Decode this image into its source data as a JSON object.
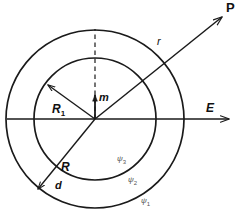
{
  "figure": {
    "background": "#ffffff",
    "stroke_color": "#1a1a1a",
    "label_color": "#111111",
    "region_label_color": "#555555",
    "width": 245,
    "height": 216
  },
  "geometry": {
    "center": {
      "x": 95,
      "y": 119
    },
    "inner_circle_radius": 61,
    "outer_circle_radius": 89
  },
  "labels": {
    "point_P": "P",
    "field_E": "E",
    "distance_r": "r",
    "dipole_m": "m",
    "radius_inner": "R",
    "radius_inner_sub": "1",
    "radius_outer": "R",
    "thickness_d": "d",
    "potential_region_3": "ψ",
    "potential_region_3_sub": "3",
    "potential_region_2": "ψ",
    "potential_region_2_sub": "2",
    "potential_region_1": "ψ",
    "potential_region_1_sub": "1"
  }
}
